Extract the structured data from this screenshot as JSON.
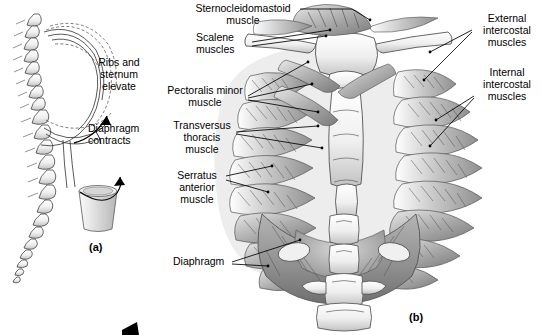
{
  "figure": {
    "title_alt": "Mechanics of breathing: rib and diaphragm movement and thoracic muscles",
    "background_color": "#ffffff",
    "ink_color": "#000000"
  },
  "panel_a": {
    "caption": "(a)",
    "labels": [
      {
        "id": "ribs-sternum-elevate",
        "text": "Ribs and\nsternum\nelevate"
      },
      {
        "id": "diaphragm-contracts",
        "text": "Diaphragm\ncontracts"
      }
    ],
    "elements": [
      {
        "id": "vertebral-column",
        "name": "lateral-spine"
      },
      {
        "id": "rib-resting",
        "name": "rib-position-resting"
      },
      {
        "id": "rib-elevated",
        "name": "rib-position-elevated-dashed"
      },
      {
        "id": "diaphragm-curve",
        "name": "diaphragm-outline"
      },
      {
        "id": "bucket-handle",
        "name": "bucket-handle-analogy"
      },
      {
        "id": "elevate-arrow",
        "name": "elevation-arrow"
      }
    ]
  },
  "panel_b": {
    "caption": "(b)",
    "labels": [
      {
        "id": "sternocleidomastoid",
        "text": "Sternocleidomastoid\nmuscle"
      },
      {
        "id": "scalene",
        "text": "Scalene\nmuscles"
      },
      {
        "id": "pectoralis-minor",
        "text": "Pectoralis minor\nmuscle"
      },
      {
        "id": "transversus-thoracis",
        "text": "Transversus\nthoracis\nmuscle"
      },
      {
        "id": "serratus-anterior",
        "text": "Serratus\nanterior\nmuscle"
      },
      {
        "id": "diaphragm",
        "text": "Diaphragm"
      },
      {
        "id": "external-intercostal",
        "text": "External\nintercostal\nmuscles"
      },
      {
        "id": "internal-intercostal",
        "text": "Internal\nintercostal\nmuscles"
      }
    ],
    "elements": [
      {
        "id": "rib-cage",
        "name": "anterior-rib-cage"
      },
      {
        "id": "sternum",
        "name": "sternum-manubrium-body-xiphoid"
      },
      {
        "id": "clavicle",
        "name": "clavicles"
      },
      {
        "id": "diaphragm-dome",
        "name": "diaphragm-dome-central-tendon"
      },
      {
        "id": "vertebrae",
        "name": "lumbar-vertebrae"
      }
    ]
  },
  "fragment": {
    "id": "bottom-arrowhead",
    "name": "cropped-arrowhead-fragment"
  }
}
